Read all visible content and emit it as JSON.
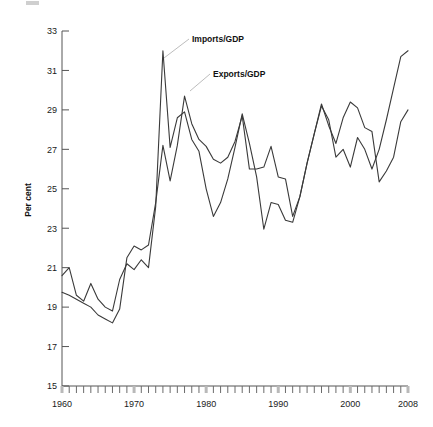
{
  "chart_data": {
    "type": "line",
    "title": "",
    "xlabel": "",
    "ylabel": "Per cent",
    "xlim": [
      1960,
      2008
    ],
    "ylim": [
      15,
      33
    ],
    "yticks": [
      15,
      17,
      19,
      21,
      23,
      25,
      27,
      29,
      31,
      33
    ],
    "xticks": [
      1960,
      1970,
      1980,
      1990,
      2000,
      2008
    ],
    "xtick_labels": [
      "1960",
      "1970",
      "1980",
      "1990",
      "2000",
      "2008"
    ],
    "ytick_labels": [
      "15",
      "17",
      "19",
      "21",
      "23",
      "25",
      "27",
      "29",
      "31",
      "33"
    ],
    "grid": false,
    "legend_position": "inline-annotation",
    "x": [
      1960,
      1961,
      1962,
      1963,
      1964,
      1965,
      1966,
      1967,
      1968,
      1969,
      1970,
      1971,
      1972,
      1973,
      1974,
      1975,
      1976,
      1977,
      1978,
      1979,
      1980,
      1981,
      1982,
      1983,
      1984,
      1985,
      1986,
      1987,
      1988,
      1989,
      1990,
      1991,
      1992,
      1993,
      1994,
      1995,
      1996,
      1997,
      1998,
      1999,
      2000,
      2001,
      2002,
      2003,
      2004,
      2005,
      2006,
      2007,
      2008
    ],
    "series": [
      {
        "name": "Imports/GDP",
        "values": [
          20.6,
          21.0,
          19.6,
          19.3,
          20.2,
          19.4,
          19.0,
          18.8,
          20.4,
          21.2,
          20.9,
          21.4,
          21.0,
          24.1,
          32.0,
          27.1,
          28.6,
          28.9,
          27.5,
          26.9,
          25.0,
          23.6,
          24.3,
          25.5,
          27.1,
          28.8,
          27.3,
          25.6,
          22.95,
          24.3,
          24.2,
          23.4,
          23.3,
          24.6,
          26.3,
          27.8,
          29.2,
          28.5,
          26.6,
          27.0,
          26.1,
          27.6,
          27.0,
          26.0,
          27.0,
          28.5,
          30.1,
          31.7,
          32.0
        ]
      },
      {
        "name": "Exports/GDP",
        "values": [
          19.75,
          19.6,
          19.4,
          19.2,
          19.0,
          18.6,
          18.4,
          18.2,
          18.9,
          21.5,
          22.1,
          21.9,
          22.15,
          24.3,
          27.2,
          25.4,
          27.2,
          29.7,
          28.3,
          27.5,
          27.15,
          26.5,
          26.3,
          26.6,
          27.4,
          28.7,
          26.0,
          26.0,
          26.1,
          27.15,
          25.6,
          25.5,
          23.6,
          24.6,
          26.3,
          27.8,
          29.3,
          28.2,
          27.3,
          28.6,
          29.4,
          29.1,
          28.1,
          27.9,
          25.35,
          25.9,
          26.6,
          28.4,
          29.0
        ]
      }
    ],
    "annotations": [
      {
        "text": "Imports/GDP",
        "label_x": 192,
        "label_y": 39,
        "leader_from_x": 189,
        "leader_from_y": 39,
        "leader_to_x": 164,
        "leader_to_y": 58
      },
      {
        "text": "Exports/GDP",
        "label_x": 213,
        "label_y": 74,
        "leader_from_x": 210,
        "leader_from_y": 74,
        "leader_to_x": 190,
        "leader_to_y": 91
      }
    ]
  }
}
